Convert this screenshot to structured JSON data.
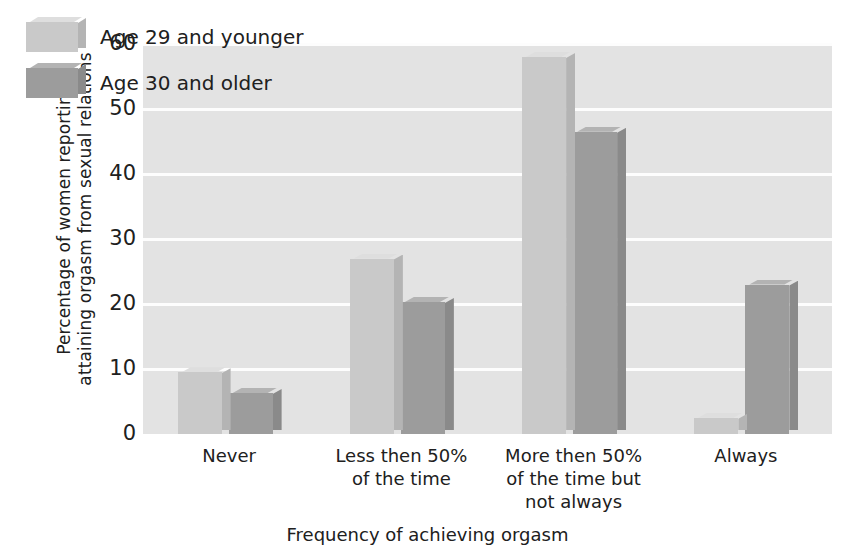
{
  "chart_data": {
    "type": "bar",
    "title": "",
    "subtitle": "",
    "xlabel": "Frequency of achieving orgasm",
    "ylabel": "Percentage of women reporting\nattaining orgasm from sexual relations",
    "categories": [
      "Never",
      "Less then 50%\nof the time",
      "More then 50%\nof the time but\nnot always",
      "Always"
    ],
    "series": [
      {
        "name": "Age 29 and younger",
        "values": [
          9.5,
          27,
          58,
          2.5
        ],
        "color": "#c9c9c9"
      },
      {
        "name": "Age 30 and older",
        "values": [
          6.3,
          20.3,
          46.5,
          23
        ],
        "color": "#9c9c9c"
      }
    ],
    "ylim": [
      0,
      60
    ],
    "yticks": [
      0,
      10,
      20,
      30,
      40,
      50,
      60
    ],
    "ytick_labels": [
      "0",
      "10",
      "20",
      "30",
      "40",
      "50",
      "60"
    ],
    "grid": "horizontal",
    "legend_position": "top-left-inside",
    "plot_background": "#e3e3e3",
    "gridline_color": "#fdfdfd",
    "style": "3d-shaded-bars"
  },
  "legend": {
    "entries": [
      {
        "label": "Age 29 and younger"
      },
      {
        "label": "Age 30 and older"
      }
    ]
  }
}
